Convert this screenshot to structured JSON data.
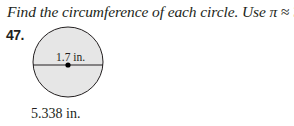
{
  "instruction": {
    "text_prefix": "Find the circumference of each circle. Use ",
    "pi_symbol": "π",
    "approx": " ≈ ",
    "pi_value": "3.14."
  },
  "problem": {
    "number": "47.",
    "diameter_label": "1.7 in.",
    "answer": "5.338 in."
  },
  "colors": {
    "circle_fill": "#e6e6e6",
    "stroke": "#231f20"
  }
}
